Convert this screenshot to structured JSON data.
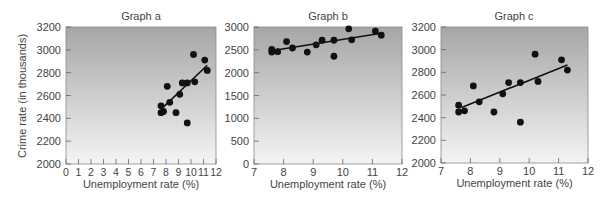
{
  "figure": {
    "y_axis_label": "Crime rate (in thousands)",
    "x_axis_label": "Unemployment rate (%)"
  },
  "colors": {
    "gradient_top": "#a6a6a6",
    "gradient_bottom": "#f4f4f4",
    "point": "#111111",
    "line": "#111111",
    "axis": "#666666"
  },
  "chart_data": [
    {
      "type": "scatter",
      "title": "Graph a",
      "xlabel": "Unemployment rate (%)",
      "ylabel": "Crime rate (in thousands)",
      "xlim": [
        0,
        12
      ],
      "ylim": [
        2000,
        3200
      ],
      "xticks": [
        0,
        1,
        2,
        3,
        4,
        5,
        6,
        7,
        8,
        9,
        10,
        11,
        12
      ],
      "yticks": [
        2000,
        2200,
        2400,
        2600,
        2800,
        3000,
        3200
      ],
      "grid": false,
      "trendline": {
        "x": [
          7.7,
          11.3
        ],
        "y": [
          2490,
          2865
        ]
      },
      "x": [
        7.6,
        7.6,
        7.8,
        8.1,
        8.3,
        8.8,
        9.1,
        9.3,
        9.7,
        9.7,
        10.2,
        10.3,
        11.1,
        11.3
      ],
      "y": [
        2510,
        2450,
        2460,
        2680,
        2540,
        2450,
        2610,
        2710,
        2710,
        2360,
        2960,
        2720,
        2910,
        2820
      ]
    },
    {
      "type": "scatter",
      "title": "Graph b",
      "xlabel": "Unemployment rate (%)",
      "ylabel": "",
      "xlim": [
        7,
        12
      ],
      "ylim": [
        0,
        3000
      ],
      "xticks": [
        7,
        8,
        9,
        10,
        11,
        12
      ],
      "yticks": [
        0,
        500,
        1000,
        1500,
        2000,
        2500,
        3000
      ],
      "grid": false,
      "trendline": {
        "x": [
          7.7,
          11.3
        ],
        "y": [
          2490,
          2865
        ]
      },
      "x": [
        7.6,
        7.6,
        7.8,
        8.1,
        8.3,
        8.8,
        9.1,
        9.3,
        9.7,
        9.7,
        10.2,
        10.3,
        11.1,
        11.3
      ],
      "y": [
        2510,
        2450,
        2460,
        2680,
        2540,
        2450,
        2610,
        2710,
        2710,
        2360,
        2960,
        2720,
        2910,
        2820
      ]
    },
    {
      "type": "scatter",
      "title": "Graph c",
      "xlabel": "Unemployment rate (%)",
      "ylabel": "",
      "xlim": [
        7,
        12
      ],
      "ylim": [
        2000,
        3200
      ],
      "xticks": [
        7,
        8,
        9,
        10,
        11,
        12
      ],
      "yticks": [
        2000,
        2200,
        2400,
        2600,
        2800,
        3000,
        3200
      ],
      "grid": false,
      "trendline": {
        "x": [
          7.7,
          11.3
        ],
        "y": [
          2490,
          2865
        ]
      },
      "x": [
        7.6,
        7.6,
        7.8,
        8.1,
        8.3,
        8.8,
        9.1,
        9.3,
        9.7,
        9.7,
        10.2,
        10.3,
        11.1,
        11.3
      ],
      "y": [
        2510,
        2450,
        2460,
        2680,
        2540,
        2450,
        2610,
        2710,
        2710,
        2360,
        2960,
        2720,
        2910,
        2820
      ]
    }
  ],
  "layout": {
    "panels": [
      {
        "left": 66,
        "top": 27,
        "right": 216,
        "bottom": 164,
        "title_x": 141,
        "ylabels_right": 61
      },
      {
        "left": 254,
        "top": 27,
        "right": 402,
        "bottom": 164,
        "title_x": 328,
        "ylabels_right": 249
      },
      {
        "left": 441,
        "top": 27,
        "right": 588,
        "bottom": 163,
        "title_x": 514,
        "ylabels_right": 436
      }
    ]
  }
}
